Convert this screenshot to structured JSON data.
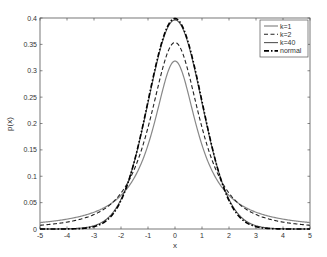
{
  "chart_data": {
    "type": "line",
    "title": "",
    "xlabel": "x",
    "ylabel": "p(x)",
    "xlim": [
      -5,
      5
    ],
    "ylim": [
      0,
      0.4
    ],
    "grid": false,
    "legend_position": "upper right",
    "x_ticks": [
      "-5",
      "-4",
      "-3",
      "-2",
      "-1",
      "0",
      "1",
      "2",
      "3",
      "4",
      "5"
    ],
    "y_ticks": [
      "0",
      "0.05",
      "0.1",
      "0.15",
      "0.2",
      "0.25",
      "0.3",
      "0.35",
      "0.4"
    ],
    "x": [
      -5,
      -4,
      -3,
      -2,
      -1,
      0,
      1,
      2,
      3,
      4,
      5
    ],
    "series": [
      {
        "name": "k=1",
        "style": "solid",
        "color": "#888888",
        "dist": "t",
        "k": 1,
        "values": [
          0.0122,
          0.0187,
          0.0318,
          0.0637,
          0.1592,
          0.3183,
          0.1592,
          0.0637,
          0.0318,
          0.0187,
          0.0122
        ]
      },
      {
        "name": "k=2",
        "style": "dashed",
        "color": "#222222",
        "dist": "t",
        "k": 2,
        "values": [
          0.0071,
          0.0131,
          0.0274,
          0.068,
          0.1925,
          0.3536,
          0.1925,
          0.068,
          0.0274,
          0.0131,
          0.0071
        ]
      },
      {
        "name": "k=40",
        "style": "solid",
        "color": "#555555",
        "dist": "t",
        "k": 40,
        "values": [
          0.0,
          0.0004,
          0.0061,
          0.0547,
          0.2396,
          0.3965,
          0.2396,
          0.0547,
          0.0061,
          0.0004,
          0.0
        ]
      },
      {
        "name": "normal",
        "style": "dashdot",
        "color": "#000000",
        "dist": "normal",
        "values": [
          0.0,
          0.0001,
          0.0044,
          0.054,
          0.242,
          0.3989,
          0.242,
          0.054,
          0.0044,
          0.0001,
          0.0
        ]
      }
    ]
  }
}
